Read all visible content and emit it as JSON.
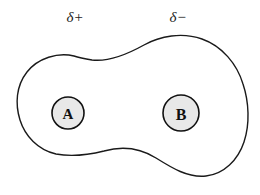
{
  "diagram": {
    "background_color": "#ffffff",
    "outline_color": "#1a1a1a",
    "electron_cloud": {
      "fill": "#ffffff",
      "stroke": "#1a1a1a",
      "stroke_width": 1.4
    },
    "labels": {
      "partial_positive": "δ+",
      "partial_negative": "δ−"
    },
    "atoms": [
      {
        "label": "A",
        "cx": 68,
        "cy": 113,
        "r": 16,
        "fill": "#e8e8e8",
        "stroke": "#111111"
      },
      {
        "label": "B",
        "cx": 181,
        "cy": 113,
        "r": 18,
        "fill": "#e8e8e8",
        "stroke": "#111111"
      }
    ],
    "label_positions": {
      "partial_positive": {
        "x": 75,
        "y": 19
      },
      "partial_negative": {
        "x": 178,
        "y": 19
      }
    }
  }
}
